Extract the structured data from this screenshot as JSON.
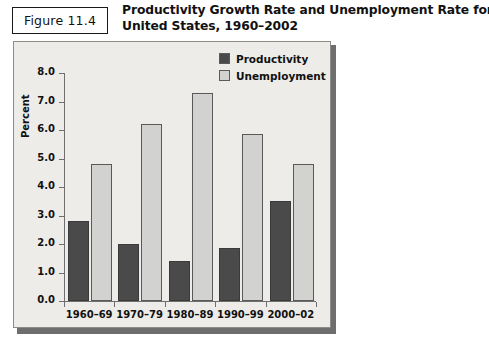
{
  "figure": {
    "label": "Figure 11.4",
    "title_line1": "Productivity Growth Rate and Unemployment Rate for the",
    "title_line2": "United States, 1960–2002"
  },
  "legend": {
    "items": [
      {
        "label": "Productivity",
        "color": "#4a4a4a",
        "swatch_icon": "legend-swatch-dark"
      },
      {
        "label": "Unemployment",
        "color": "#d2d2d0",
        "swatch_icon": "legend-swatch-light"
      }
    ]
  },
  "axes": {
    "ylabel": "Percent",
    "yticks": [
      "8.0",
      "7.0",
      "6.0",
      "5.0",
      "4.0",
      "3.0",
      "2.0",
      "1.0",
      "0.0"
    ]
  },
  "chart_data": {
    "type": "bar",
    "title": "Productivity Growth Rate and Unemployment Rate for the United States, 1960–2002",
    "xlabel": "",
    "ylabel": "Percent",
    "ylim": [
      0.0,
      8.0
    ],
    "ytick_step": 1.0,
    "grid": false,
    "legend_position": "top-right",
    "categories": [
      "1960–69",
      "1970–79",
      "1980–89",
      "1990–99",
      "2000–02"
    ],
    "series": [
      {
        "name": "Productivity",
        "color": "#4a4a4a",
        "values": [
          2.8,
          2.0,
          1.4,
          1.85,
          3.5
        ]
      },
      {
        "name": "Unemployment",
        "color": "#d2d2d0",
        "values": [
          4.8,
          6.2,
          7.3,
          5.85,
          4.8
        ]
      }
    ]
  }
}
